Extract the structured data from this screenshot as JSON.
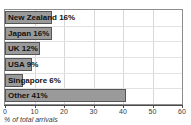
{
  "chart_data": {
    "type": "bar",
    "orientation": "horizontal",
    "title": "",
    "xlabel": "% of total arrivals",
    "ylabel": "",
    "xlim": [
      0,
      60
    ],
    "xticks": [
      0,
      10,
      20,
      30,
      40,
      50,
      60
    ],
    "grid": true,
    "legend": null,
    "categories": [
      "New Zealand",
      "Japan",
      "UK",
      "USA",
      "Singapore",
      "Other"
    ],
    "values": [
      16,
      16,
      12,
      9,
      6,
      41
    ],
    "bar_labels": [
      "New Zealand 16%",
      "Japan 16%",
      "UK 12%",
      "USA 9%",
      "Singapore 6%",
      "Other 41%"
    ],
    "colors": {
      "bar_fill": "#9a9a9a",
      "bar_edge": "#555555",
      "grid": "#d8d8d8",
      "axis": "#4a4a4a",
      "frame": "#8d8d8d",
      "label_text": "#111111",
      "background": "#ffffff"
    }
  },
  "header": {
    "title_fragment": " "
  },
  "axis": {
    "tick_labels": [
      "0",
      "10",
      "20",
      "30",
      "40",
      "50",
      "60"
    ],
    "axis_title": "% of total arrivals"
  }
}
